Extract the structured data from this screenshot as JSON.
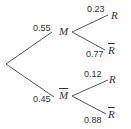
{
  "tree": {
    "root": {
      "branches": [
        {
          "node": "M",
          "node_bar": false,
          "probability": "0.55",
          "branches": [
            {
              "node": "R",
              "node_bar": false,
              "probability": "0.23"
            },
            {
              "node": "R",
              "node_bar": true,
              "probability": "0.77"
            }
          ]
        },
        {
          "node": "M",
          "node_bar": true,
          "probability": "0.45",
          "branches": [
            {
              "node": "R",
              "node_bar": false,
              "probability": "0.12"
            },
            {
              "node": "R",
              "node_bar": true,
              "probability": "0.88"
            }
          ]
        }
      ]
    }
  },
  "colors": {
    "line": "#555555",
    "text": "#333333"
  }
}
